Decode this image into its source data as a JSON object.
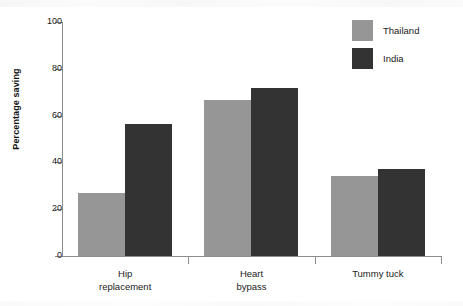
{
  "chart_data": {
    "type": "bar",
    "title": "",
    "subtitle": "",
    "xlabel": "",
    "ylabel": "Percentage saving",
    "categories": [
      "Hip replacement",
      "Heart bypass",
      "Tummy tuck"
    ],
    "category_lines": [
      [
        "Hip",
        "replacement"
      ],
      [
        "Heart",
        "bypass"
      ],
      [
        "Tummy tuck"
      ]
    ],
    "series": [
      {
        "name": "Thailand",
        "color": "#969696",
        "values": [
          27,
          66.5,
          34
        ]
      },
      {
        "name": "India",
        "color": "#333333",
        "values": [
          56.5,
          72,
          37
        ]
      }
    ],
    "ylim": [
      0,
      100
    ],
    "yticks": [
      0,
      20,
      40,
      60,
      80,
      100
    ],
    "ytick_labels": [
      "0",
      "20",
      "40",
      "60",
      "80",
      "100"
    ],
    "grid": false,
    "legend_position": "top-right",
    "legend_entries": [
      "Thailand",
      "India"
    ]
  },
  "axes": {
    "y_title": "Percentage saving"
  }
}
